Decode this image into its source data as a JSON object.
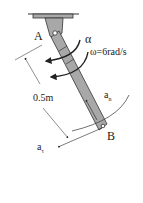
{
  "diagram": {
    "type": "rotating-bar-kinematics",
    "labels": {
      "pivot": "A",
      "end": "B",
      "angular_acceleration": "α",
      "angular_velocity": "ω=6rad/s",
      "length": "0.5m",
      "normal_accel_main": "a",
      "normal_accel_sub": "n",
      "tangential_accel_main": "a",
      "tangential_accel_sub": "τ"
    },
    "colors": {
      "bar_fill": "#a8a8a8",
      "stroke": "#333333",
      "background": "#ffffff"
    }
  }
}
